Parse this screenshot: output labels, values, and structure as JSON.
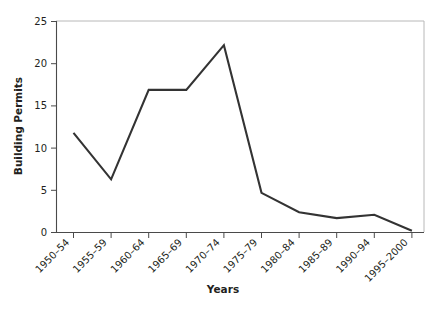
{
  "chart_data": {
    "type": "line",
    "title": "",
    "subtitle": "",
    "xlabel": "Years",
    "ylabel": "Building Permits",
    "categories": [
      "1950–54",
      "1955–59",
      "1960–64",
      "1965–69",
      "1970–74",
      "1975–79",
      "1980–84",
      "1985–89",
      "1990–94",
      "1995–2000"
    ],
    "values": [
      11.8,
      6.3,
      16.9,
      16.9,
      22.2,
      4.7,
      2.4,
      1.7,
      2.1,
      0.2
    ],
    "series": [
      {
        "name": "Building Permits",
        "values": [
          11.8,
          6.3,
          16.9,
          16.9,
          22.2,
          4.7,
          2.4,
          1.7,
          2.1,
          0.2
        ]
      }
    ],
    "ylim": [
      0,
      25
    ],
    "y_ticks": [
      0,
      5,
      10,
      15,
      20,
      25
    ],
    "y_tick_labels": [
      "0",
      "5",
      "10",
      "15",
      "20",
      "25"
    ],
    "grid": false,
    "legend": false,
    "legend_position": "none",
    "line_color": "#333333",
    "axis_color": "#4a4a4a",
    "frame_color": "#b8b8b8",
    "text_color": "#231f20",
    "background": "#ffffff"
  },
  "axes": {
    "y_title": "Building Permits",
    "x_title": "Years"
  }
}
